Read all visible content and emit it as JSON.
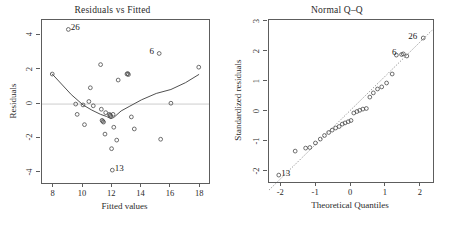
{
  "figure": {
    "width": 449,
    "height": 225,
    "background": "#ffffff",
    "ink_color": "#4a4a4a",
    "reference_line_color": "#c0c0c0"
  },
  "chart_data": [
    {
      "type": "scatter",
      "name": "residuals-vs-fitted",
      "title": "Residuals vs Fitted",
      "xlabel": "Fitted values",
      "ylabel": "Residuals",
      "xlim": [
        7.2,
        18.6
      ],
      "ylim": [
        -4.6,
        4.9
      ],
      "xticks": [
        8,
        10,
        12,
        14,
        16,
        18
      ],
      "xticklabels": [
        "8",
        "10",
        "12",
        "14",
        "16",
        "18"
      ],
      "yticks": [
        -4,
        -2,
        0,
        2,
        4
      ],
      "yticklabels": [
        "-4",
        "-2",
        "0",
        "2",
        "4"
      ],
      "grid": false,
      "legend": "none",
      "hline": 0,
      "x": [
        7.9,
        9.0,
        9.5,
        9.6,
        10.0,
        10.1,
        10.4,
        10.5,
        10.7,
        11.2,
        11.25,
        11.3,
        11.35,
        11.4,
        11.5,
        11.55,
        11.8,
        11.85,
        11.9,
        11.95,
        12.0,
        12.05,
        12.1,
        12.3,
        12.4,
        13.0,
        13.05,
        13.1,
        13.3,
        13.5,
        15.2,
        15.3,
        16.0,
        17.9
      ],
      "y": [
        1.75,
        4.35,
        0.0,
        -0.6,
        -0.05,
        -1.2,
        0.15,
        0.95,
        -0.1,
        2.3,
        -0.3,
        -0.95,
        -1.0,
        -1.05,
        -1.75,
        -0.5,
        -0.6,
        -0.65,
        -0.7,
        -2.6,
        -3.85,
        -0.6,
        -1.35,
        -2.1,
        1.4,
        1.75,
        1.78,
        1.72,
        -0.75,
        -1.45,
        2.95,
        -2.05,
        0.05,
        2.15
      ],
      "smoother": {
        "x": [
          7.9,
          9.2,
          10.0,
          10.6,
          11.2,
          11.6,
          11.9,
          12.1,
          12.6,
          13.2,
          14.0,
          15.0,
          16.0,
          17.0,
          17.9
        ],
        "y": [
          1.75,
          0.55,
          -0.05,
          -0.35,
          -0.6,
          -0.72,
          -0.85,
          -0.78,
          -0.4,
          -0.12,
          0.25,
          0.62,
          0.85,
          1.25,
          1.72
        ]
      },
      "annotations": [
        {
          "label": "26",
          "x": 9.0,
          "y": 4.35,
          "side": "right"
        },
        {
          "label": "6",
          "x": 15.2,
          "y": 2.95,
          "side": "left"
        },
        {
          "label": "13",
          "x": 12.0,
          "y": -3.85,
          "side": "right"
        }
      ]
    },
    {
      "type": "scatter",
      "name": "normal-qq",
      "title": "Normal Q–Q",
      "xlabel": "Theoretical Quantiles",
      "ylabel": "Standardized residuals",
      "xlim": [
        -2.35,
        2.35
      ],
      "ylim": [
        -2.35,
        3.05
      ],
      "xticks": [
        -2,
        -1,
        0,
        1,
        2
      ],
      "xticklabels": [
        "-2",
        "-1",
        "0",
        "1",
        "2"
      ],
      "yticks": [
        -2,
        -1,
        0,
        1,
        2,
        3
      ],
      "yticklabels": [
        "-2",
        "-1",
        "0",
        "1",
        "2",
        "3"
      ],
      "grid": false,
      "legend": "none",
      "qqline": {
        "intercept": 0.06,
        "slope": 1.14
      },
      "x": [
        -2.07,
        -1.6,
        -1.3,
        -1.18,
        -1.02,
        -0.88,
        -0.76,
        -0.64,
        -0.54,
        -0.44,
        -0.34,
        -0.25,
        -0.17,
        -0.08,
        0.0,
        0.08,
        0.17,
        0.25,
        0.34,
        0.44,
        0.54,
        0.64,
        0.76,
        0.88,
        1.02,
        1.18,
        1.3,
        1.45,
        1.5,
        1.6,
        2.07
      ],
      "y": [
        -2.12,
        -1.32,
        -1.22,
        -1.2,
        -1.05,
        -0.92,
        -0.8,
        -0.7,
        -0.62,
        -0.55,
        -0.5,
        -0.42,
        -0.38,
        -0.34,
        -0.3,
        -0.05,
        0.0,
        0.04,
        0.08,
        0.1,
        0.48,
        0.62,
        0.75,
        0.82,
        0.95,
        1.25,
        1.88,
        1.9,
        1.92,
        1.85,
        2.45
      ],
      "annotations": [
        {
          "label": "13",
          "x": -2.07,
          "y": -2.12,
          "side": "right"
        },
        {
          "label": "6",
          "x": 1.45,
          "y": 1.9,
          "side": "left"
        },
        {
          "label": "26",
          "x": 2.07,
          "y": 2.45,
          "side": "left"
        }
      ]
    }
  ]
}
